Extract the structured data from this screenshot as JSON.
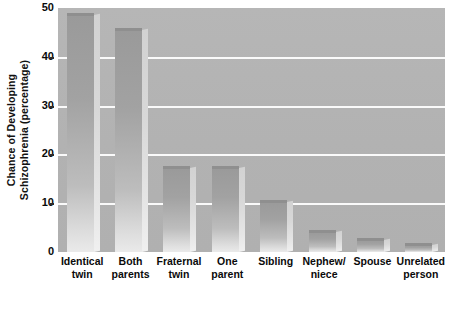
{
  "chart_data": {
    "type": "bar",
    "title": "",
    "xlabel": "",
    "ylabel_line1": "Chance of Developing",
    "ylabel_line2": "Schizophrenia (percentage)",
    "ylim": [
      0,
      50
    ],
    "yticks": [
      0,
      10,
      20,
      30,
      40,
      50
    ],
    "ytick_labels": [
      "0",
      "10",
      "20",
      "30",
      "40",
      "50"
    ],
    "grid": true,
    "grid_axis": "y",
    "legend": "none",
    "categories": [
      "Identical twin",
      "Both parents",
      "Fraternal twin",
      "One parent",
      "Sibling",
      "Nephew/ niece",
      "Spouse",
      "Unrelated person"
    ],
    "category_lines": [
      [
        "Identical",
        "twin"
      ],
      [
        "Both",
        "parents"
      ],
      [
        "Fraternal",
        "twin"
      ],
      [
        "One",
        "parent"
      ],
      [
        "Sibling",
        ""
      ],
      [
        "Nephew/",
        "niece"
      ],
      [
        "Spouse",
        ""
      ],
      [
        "Unrelated",
        "person"
      ]
    ],
    "values": [
      48.5,
      45.5,
      17.3,
      17.3,
      10.3,
      4,
      2.5,
      1.5
    ],
    "colors": {
      "plot_background": "#b3b3b3",
      "gridline": "#fafafa",
      "bar_top": "#9a9a9a",
      "bar_bottom": "#eaeaea",
      "bar_side": "#dcdcdc",
      "text": "#0a0a0a",
      "page_background": "#ffffff"
    }
  }
}
